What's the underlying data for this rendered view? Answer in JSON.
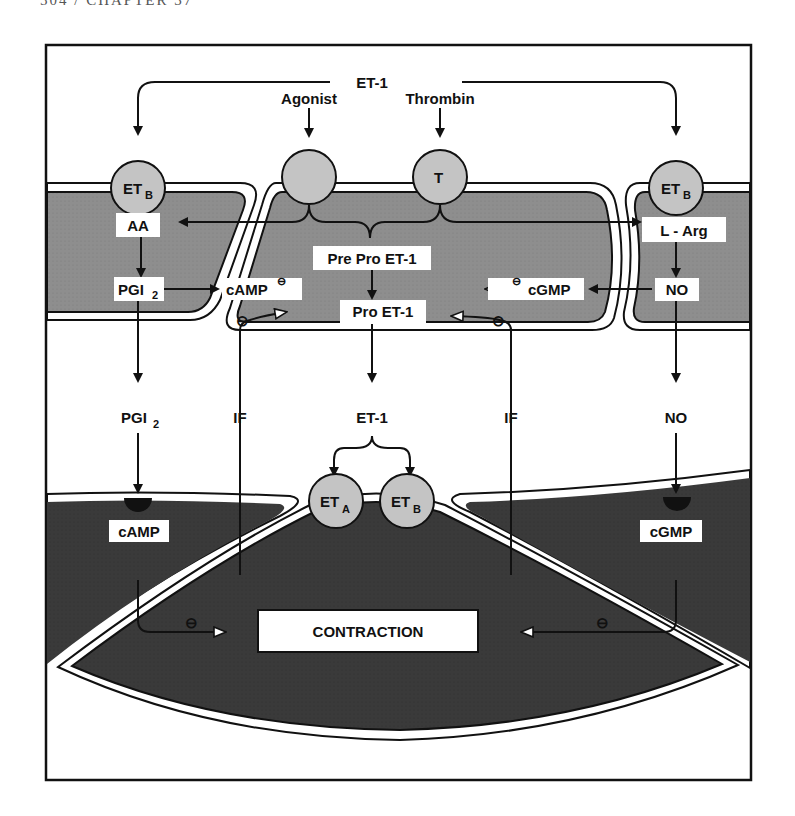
{
  "page_header": {
    "text": "504  /  CHAPTER 37"
  },
  "colors": {
    "endothelial_fill": "#8c8c8c",
    "smooth_muscle_fill": "#3c3c3c",
    "receptor_fill": "#c4c4c4",
    "label_bg": "#ffffff",
    "line": "#111111"
  },
  "top_inputs": {
    "et1": "ET-1",
    "agonist": "Agonist",
    "thrombin": "Thrombin"
  },
  "receptors": {
    "left_etb": {
      "base": "ET",
      "sub": "B"
    },
    "agonist_receptor": {
      "base": "",
      "sub": ""
    },
    "thrombin_receptor": {
      "base": "T",
      "sub": ""
    },
    "right_etb": {
      "base": "ET",
      "sub": "B"
    },
    "muscle_eta": {
      "base": "ET",
      "sub": "A"
    },
    "muscle_etb": {
      "base": "ET",
      "sub": "B"
    }
  },
  "endothelium": {
    "aa": "AA",
    "pgi2": {
      "base": "PGI",
      "sub": "2"
    },
    "camp": "cAMP",
    "pre_pro_et1": "Pre Pro ET-1",
    "pro_et1": "Pro ET-1",
    "cgmp": "cGMP",
    "l_arg": "L - Arg",
    "no": "NO",
    "inhibit_symbol": "⊖"
  },
  "interstitial": {
    "pgi2": {
      "base": "PGI",
      "sub": "2"
    },
    "if_left": "IF",
    "et1": "ET-1",
    "if_right": "IF",
    "no": "NO"
  },
  "smooth_muscle": {
    "camp": "cAMP",
    "cgmp": "cGMP",
    "contraction": "CONTRACTION"
  }
}
